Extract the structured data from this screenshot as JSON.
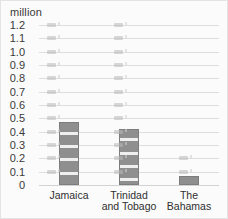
{
  "unit_caption": "million",
  "chart_data": {
    "type": "bar",
    "title": "",
    "subtitle": "",
    "xlabel": "",
    "ylabel": "million",
    "categories": [
      "Jamaica",
      "Trinidad\nand Tobago",
      "The Bahamas"
    ],
    "values": [
      0.47,
      0.42,
      0.07
    ],
    "ylim": [
      0,
      1.2
    ],
    "ytick_labels": [
      "1.2",
      "1.1",
      "1.0",
      "0.9",
      "0.8",
      "0.7",
      "0.6",
      "0.5",
      "0.4",
      "0.3",
      "0.2",
      "0.1",
      "0"
    ],
    "ytick_values": [
      1.2,
      1.1,
      1.0,
      0.9,
      0.8,
      0.7,
      0.6,
      0.5,
      0.4,
      0.3,
      0.2,
      0.1,
      0
    ],
    "grid": true,
    "grid_orientation": "horizontal",
    "legend": false,
    "legend_position": "none",
    "bar_color": "#8f8f8f",
    "grid_color": "#dedede",
    "background_color": "#fbfbfb",
    "text_color": "#3a3a3a"
  }
}
